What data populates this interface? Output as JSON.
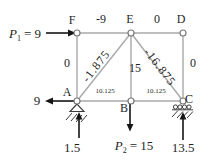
{
  "diagram": {
    "type": "truss-free-body-diagram",
    "nodes": {
      "f": "F",
      "e": "E",
      "d": "D",
      "a": "A",
      "b": "B",
      "c": "C"
    },
    "member_forces": {
      "fe": "-9",
      "ed": "0",
      "fa": "0",
      "ae": "-1.875",
      "eb": "15",
      "ec": "-16.875",
      "dc": "0",
      "ab": "10.125",
      "bc": "10.125"
    },
    "loads": {
      "p1": {
        "symbol": "P",
        "subscript": "1",
        "value": "= 9"
      },
      "p2": {
        "symbol": "P",
        "subscript": "2",
        "value": "= 15"
      },
      "horizontal_at_a": "9"
    },
    "reactions": {
      "at_a": "1.5",
      "at_c": "13.5"
    },
    "colors": {
      "member": "#a8a8a8",
      "arrow": "#151515",
      "text": "#1f1f1f",
      "background": "#ffffff"
    }
  }
}
